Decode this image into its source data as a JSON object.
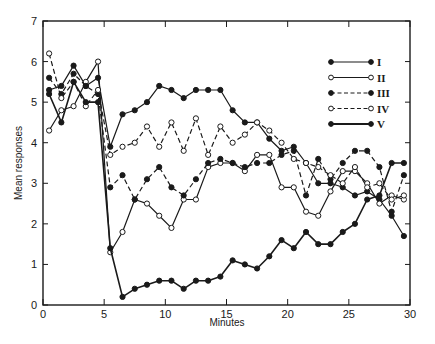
{
  "chart_data": {
    "type": "line",
    "title": "",
    "xlabel": "Minutes",
    "ylabel": "Mean responses",
    "xlim": [
      0,
      30
    ],
    "ylim": [
      0,
      7
    ],
    "xticks": [
      0,
      5,
      10,
      15,
      20,
      25,
      30
    ],
    "yticks": [
      0,
      1,
      2,
      3,
      4,
      5,
      6,
      7
    ],
    "grid": false,
    "legend_position": "top-right",
    "x": [
      0.5,
      1.5,
      2.5,
      3.5,
      4.5,
      5.5,
      6.5,
      7.5,
      8.5,
      9.5,
      10.5,
      11.5,
      12.5,
      13.5,
      14.5,
      15.5,
      16.5,
      17.5,
      18.5,
      19.5,
      20.5,
      21.5,
      22.5,
      23.5,
      24.5,
      25.5,
      26.5,
      27.5,
      28.5,
      29.5
    ],
    "series": [
      {
        "name": "I",
        "line": "solid",
        "marker": "filled",
        "values": [
          5.3,
          5.4,
          5.9,
          5.4,
          5.6,
          3.9,
          4.7,
          4.8,
          5.0,
          5.4,
          5.3,
          5.1,
          5.3,
          5.3,
          5.3,
          4.8,
          4.5,
          4.5,
          4.1,
          3.8,
          3.9,
          3.5,
          3.0,
          3.0,
          2.9,
          2.7,
          2.8,
          2.6,
          2.2,
          1.7
        ]
      },
      {
        "name": "II",
        "line": "solid",
        "marker": "open",
        "values": [
          4.3,
          4.8,
          4.9,
          5.5,
          6.0,
          1.3,
          1.8,
          2.6,
          2.5,
          2.2,
          1.9,
          2.6,
          2.6,
          3.4,
          3.5,
          3.5,
          3.3,
          3.7,
          3.7,
          2.9,
          2.9,
          2.3,
          2.2,
          2.8,
          3.3,
          3.3,
          3.0,
          2.5,
          2.7,
          2.6
        ]
      },
      {
        "name": "III",
        "line": "dashed",
        "marker": "filled",
        "values": [
          5.6,
          5.2,
          5.7,
          5.4,
          5.2,
          2.9,
          3.2,
          2.6,
          3.1,
          3.4,
          2.9,
          2.7,
          3.1,
          3.5,
          3.6,
          3.5,
          3.4,
          3.5,
          3.5,
          3.7,
          3.8,
          2.7,
          3.6,
          3.1,
          3.5,
          3.8,
          3.8,
          3.4,
          2.3,
          3.2
        ]
      },
      {
        "name": "IV",
        "line": "dashed",
        "marker": "open",
        "values": [
          6.2,
          5.1,
          5.5,
          4.9,
          5.3,
          3.7,
          3.9,
          4.0,
          4.4,
          3.9,
          4.5,
          3.8,
          4.6,
          3.7,
          4.4,
          4.0,
          4.2,
          4.5,
          4.3,
          4.0,
          3.6,
          3.5,
          3.4,
          3.2,
          3.0,
          3.4,
          2.9,
          3.0,
          2.6,
          2.7
        ]
      },
      {
        "name": "V",
        "line": "solid",
        "marker": "filled",
        "values": [
          5.2,
          4.5,
          5.5,
          5.0,
          5.0,
          1.4,
          0.2,
          0.4,
          0.5,
          0.6,
          0.6,
          0.4,
          0.6,
          0.6,
          0.7,
          1.1,
          1.0,
          0.9,
          1.2,
          1.6,
          1.4,
          1.8,
          1.5,
          1.5,
          1.8,
          2.0,
          2.6,
          2.7,
          3.5,
          3.5
        ]
      }
    ]
  }
}
